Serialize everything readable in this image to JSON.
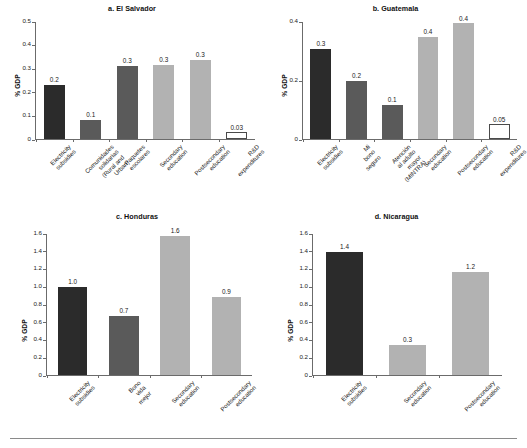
{
  "figure": {
    "width": 527,
    "height": 448,
    "background": "#ffffff",
    "footer_rule": true
  },
  "colors": {
    "dark": "#2b2b2b",
    "medium": "#5a5a5a",
    "light": "#b2b2b2",
    "white": "#ffffff",
    "outline": "#4a4a4a",
    "axis": "#6b6b6b",
    "text": "#1a1a1a"
  },
  "chart_data": [
    {
      "type": "bar",
      "title": "a. El Salvador",
      "xlabel": "",
      "ylabel": "% GDP",
      "ylim": [
        0,
        0.5
      ],
      "yticks": [
        "0",
        "0.1",
        "0.2",
        "0.3",
        "0.4",
        "0.5"
      ],
      "ytick_values": [
        0,
        0.1,
        0.2,
        0.3,
        0.4,
        0.5
      ],
      "grid": false,
      "legend": "none",
      "categories": [
        "Electricity subsidies",
        "Comunidades solidarias\n(Rural and Urban)",
        "Paquetes escolares",
        "Secondary education",
        "Postsecondary\neducation",
        "R&D expenditures"
      ],
      "values": [
        0.232,
        0.08,
        0.313,
        0.318,
        0.336,
        0.03
      ],
      "data_labels": [
        "0.2",
        "0.1",
        "0.3",
        "0.3",
        "0.3",
        "0.03"
      ],
      "bar_styles": [
        "dark",
        "medium",
        "medium",
        "light",
        "light",
        "white"
      ]
    },
    {
      "type": "bar",
      "title": "b. Guatemala",
      "xlabel": "",
      "ylabel": "% GDP",
      "ylim": [
        0,
        0.4
      ],
      "yticks": [
        "0",
        "0.2",
        "0.4"
      ],
      "ytick_values": [
        0,
        0.2,
        0.4
      ],
      "grid": false,
      "legend": "none",
      "categories": [
        "Electricity subsidies",
        "Mi bono seguro",
        "Atención al adulto\nmayor (MINTRA)",
        "Secondary education",
        "Postsecondary\neducation",
        "R&D expenditures"
      ],
      "values": [
        0.307,
        0.2,
        0.118,
        0.35,
        0.395,
        0.05
      ],
      "data_labels": [
        "0.3",
        "0.2",
        "0.1",
        "0.4",
        "0.4",
        "0.05"
      ],
      "bar_styles": [
        "dark",
        "medium",
        "medium",
        "light",
        "light",
        "white"
      ]
    },
    {
      "type": "bar",
      "title": "c. Honduras",
      "xlabel": "",
      "ylabel": "% GDP",
      "ylim": [
        0,
        1.6
      ],
      "yticks": [
        "0",
        "0.2",
        "0.4",
        "0.6",
        "0.8",
        "1.0",
        "1.2",
        "1.4",
        "1.6"
      ],
      "ytick_values": [
        0,
        0.2,
        0.4,
        0.6,
        0.8,
        1.0,
        1.2,
        1.4,
        1.6
      ],
      "grid": false,
      "legend": "none",
      "categories": [
        "Electricity\nsubsidies",
        "Bono vida\nmejor",
        "Secondary\neducation",
        "Postsecondary\neducation"
      ],
      "values": [
        1.0,
        0.67,
        1.58,
        0.89
      ],
      "data_labels": [
        "1.0",
        "0.7",
        "1.6",
        "0.9"
      ],
      "bar_styles": [
        "dark",
        "medium",
        "light",
        "light"
      ]
    },
    {
      "type": "bar",
      "title": "d. Nicaragua",
      "xlabel": "",
      "ylabel": "% GDP",
      "ylim": [
        0,
        1.6
      ],
      "yticks": [
        "0",
        "0.2",
        "0.4",
        "0.6",
        "0.8",
        "1.0",
        "1.2",
        "1.4",
        "1.6"
      ],
      "ytick_values": [
        0,
        0.2,
        0.4,
        0.6,
        0.8,
        1.0,
        1.2,
        1.4,
        1.6
      ],
      "grid": false,
      "legend": "none",
      "categories": [
        "Electricity\nsubsidies",
        "Secondary\neducation",
        "Postsecondary\neducation"
      ],
      "values": [
        1.4,
        0.34,
        1.17
      ],
      "data_labels": [
        "1.4",
        "0.3",
        "1.2"
      ],
      "bar_styles": [
        "dark",
        "light",
        "light"
      ]
    }
  ]
}
